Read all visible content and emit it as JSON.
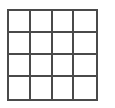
{
  "grid": {
    "rows": 4,
    "cols": 4,
    "line_color": "#4a4a4a",
    "background": "#ffffff",
    "cells": [
      [
        "",
        "",
        "",
        ""
      ],
      [
        "",
        "",
        "",
        ""
      ],
      [
        "",
        "",
        "",
        ""
      ],
      [
        "",
        "",
        "",
        ""
      ]
    ]
  }
}
